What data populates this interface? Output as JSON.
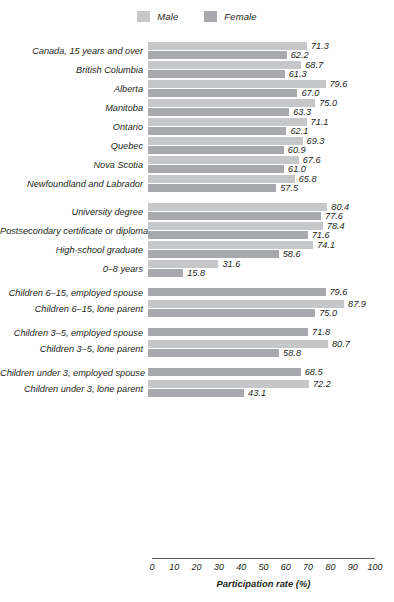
{
  "legend": {
    "items": [
      {
        "label": "Male",
        "color": "#c6c7c9",
        "name": "legend-male"
      },
      {
        "label": "Female",
        "color": "#a7a9ac",
        "name": "legend-female"
      }
    ]
  },
  "axis": {
    "title": "Participation rate (%)",
    "ticks": [
      "0",
      "10",
      "20",
      "30",
      "40",
      "50",
      "60",
      "70",
      "80",
      "90",
      "100"
    ],
    "min": 0,
    "max": 100
  },
  "chart_data": {
    "type": "bar",
    "title": "",
    "xlabel": "Participation rate (%)",
    "ylabel": "",
    "xlim": [
      0,
      100
    ],
    "grid": false,
    "orientation": "horizontal",
    "legend_position": "top-center",
    "series": [
      {
        "name": "Male",
        "color": "#c6c7c9"
      },
      {
        "name": "Female",
        "color": "#a7a9ac"
      }
    ],
    "groups": [
      {
        "name": "geography",
        "rows": [
          {
            "label": "Canada, 15 years and over",
            "Male": 71.3,
            "Female": 62.2
          },
          {
            "label": "British Columbia",
            "Male": 68.7,
            "Female": 61.3
          },
          {
            "label": "Alberta",
            "Male": 79.6,
            "Female": 67.0
          },
          {
            "label": "Manitoba",
            "Male": 75.0,
            "Female": 63.3
          },
          {
            "label": "Ontario",
            "Male": 71.1,
            "Female": 62.1
          },
          {
            "label": "Quebec",
            "Male": 69.3,
            "Female": 60.9
          },
          {
            "label": "Nova Scotia",
            "Male": 67.6,
            "Female": 61.0
          },
          {
            "label": "Newfoundland and Labrador",
            "Male": 65.8,
            "Female": 57.5
          }
        ]
      },
      {
        "name": "education",
        "rows": [
          {
            "label": "University degree",
            "Male": 80.4,
            "Female": 77.6
          },
          {
            "label": "Postsecondary certificate or diploma",
            "Male": 78.4,
            "Female": 71.6
          },
          {
            "label": "High-school graduate",
            "Male": 74.1,
            "Female": 58.6
          },
          {
            "label": "0–8 years",
            "Male": 31.6,
            "Female": 15.8
          }
        ]
      },
      {
        "name": "children-6-15",
        "rows": [
          {
            "label": "Children 6–15, employed spouse",
            "Female": 79.6
          },
          {
            "label": "Children 6–15, lone parent",
            "Male": 87.9,
            "Female": 75.0
          }
        ]
      },
      {
        "name": "children-3-5",
        "rows": [
          {
            "label": "Children 3–5, employed spouse",
            "Female": 71.8
          },
          {
            "label": "Children 3–5, lone parent",
            "Male": 80.7,
            "Female": 58.8
          }
        ]
      },
      {
        "name": "children-under-3",
        "rows": [
          {
            "label": "Children under 3, employed spouse",
            "Female": 68.5
          },
          {
            "label": "Children under 3, lone parent",
            "Male": 72.2,
            "Female": 43.1
          }
        ]
      }
    ]
  }
}
